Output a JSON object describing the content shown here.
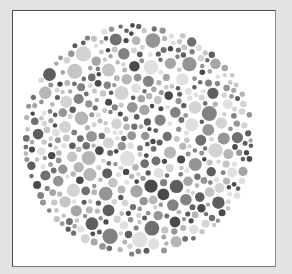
{
  "figure": {
    "type": "ishihara-color-plate",
    "style": "grayscale",
    "background_color": "#e3e3e3",
    "panel_color": "#ffffff"
  },
  "plate": {
    "center_x": 138,
    "center_y": 140,
    "radius": 117,
    "dot_count": 620,
    "min_dot_radius": 2.2,
    "max_dot_radius": 7.8,
    "seed": 7331,
    "palette": [
      "#4a4a4a",
      "#5e5e5e",
      "#707070",
      "#828282",
      "#959595",
      "#a6a6a6",
      "#b6b6b6",
      "#c5c5c5",
      "#d3d3d3",
      "#e0e0e0"
    ]
  }
}
